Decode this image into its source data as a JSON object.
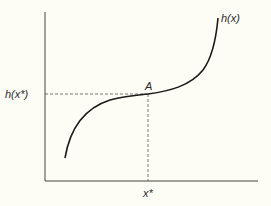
{
  "diagram": {
    "curve_label": "h(x)",
    "y_axis_marker_label": "h(x*)",
    "x_axis_marker_label": "x*",
    "point_label": "A",
    "colors": {
      "background": "#fdfdf5",
      "curve": "#1a1a1a",
      "axes": "#444444",
      "dashed": "#555555"
    }
  }
}
